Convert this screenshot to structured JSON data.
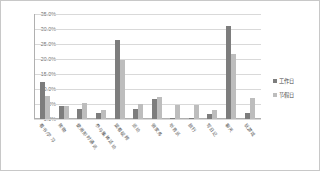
{
  "chart_data": {
    "type": "bar",
    "title": "",
    "subtitle": "",
    "xlabel": "",
    "ylabel": "",
    "ylim": [
      0,
      35
    ],
    "ytick_labels": [
      "35.0%",
      "30.0%",
      "25.0%",
      "20.0%",
      "15.0%",
      "10.0%",
      "5.0%",
      "0.0%"
    ],
    "ytick_values": [
      35,
      30,
      25,
      20,
      15,
      10,
      5,
      0
    ],
    "grid": true,
    "legend_position": "right",
    "categories": [
      "看书/学习",
      "购物",
      "使用即时通讯",
      "参与集体活动",
      "观看视频",
      "运动",
      "做家务",
      "听音乐",
      "旅行",
      "写日记",
      "聊天",
      "玩游戏"
    ],
    "series": [
      {
        "name": "工作日",
        "color": "#7d7d7d",
        "values": [
          12.2,
          4.4,
          3.5,
          1.9,
          26.2,
          3.4,
          6.6,
          0.4,
          0.5,
          1.6,
          31.1,
          2.1
        ]
      },
      {
        "name": "节假日",
        "color": "#bdbdbd",
        "values": [
          7.7,
          4.2,
          5.3,
          2.9,
          19.7,
          5.1,
          7.4,
          4.6,
          4.6,
          3.0,
          21.7,
          6.9
        ]
      }
    ]
  },
  "legend": {
    "items": [
      {
        "label": "工作日"
      },
      {
        "label": "节假日"
      }
    ]
  }
}
